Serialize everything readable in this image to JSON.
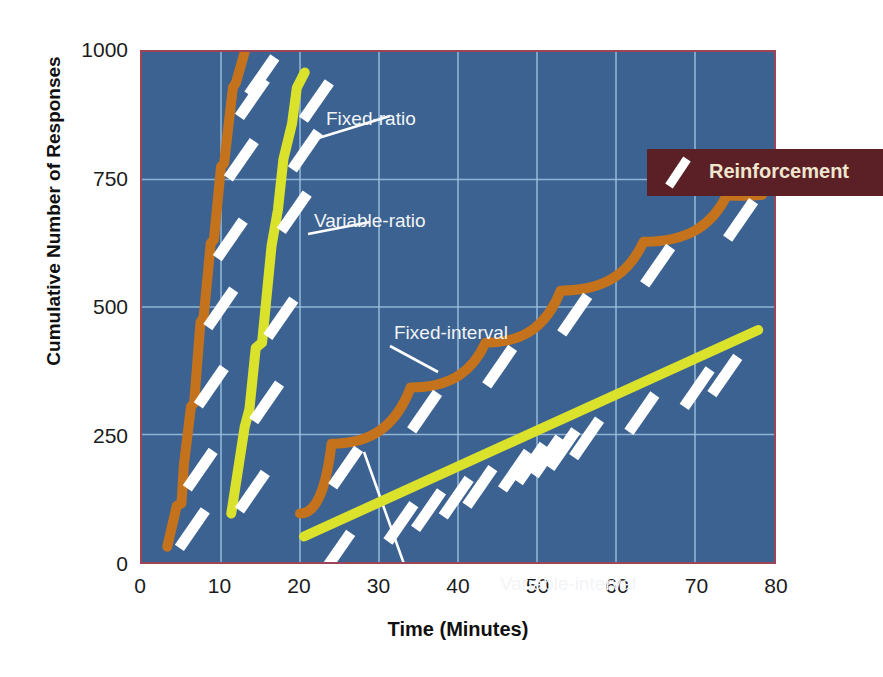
{
  "chart_data": {
    "type": "line",
    "title": "",
    "xlabel": "Time (Minutes)",
    "ylabel": "Cumulative Number of Responses",
    "xlim": [
      0,
      80
    ],
    "ylim": [
      0,
      1000
    ],
    "xticks": [
      0,
      10,
      20,
      30,
      40,
      50,
      60,
      70,
      80
    ],
    "yticks": [
      0,
      250,
      500,
      750,
      1000
    ],
    "grid": true,
    "background_color": "#3b6291",
    "grid_color": "#9fc4e0",
    "frame_color": "#9e4458",
    "legend": {
      "position": "top-right-inside",
      "box_color": "#5b2026",
      "text_color": "#efe6cf",
      "entries": [
        {
          "label": "Reinforcement",
          "marker": "white-tick-mark",
          "color": "#ffffff"
        }
      ]
    },
    "series": [
      {
        "name": "Fixed-ratio",
        "color": "#c4721c",
        "label_color": "#f2f4f6",
        "points": [
          [
            3.2,
            30
          ],
          [
            4.4,
            110
          ],
          [
            5.0,
            115
          ],
          [
            5.3,
            190
          ],
          [
            6.2,
            305
          ],
          [
            6.6,
            312
          ],
          [
            7.4,
            470
          ],
          [
            7.8,
            480
          ],
          [
            8.7,
            625
          ],
          [
            9.1,
            632
          ],
          [
            10.0,
            775
          ],
          [
            10.4,
            782
          ],
          [
            11.5,
            930
          ],
          [
            11.9,
            940
          ],
          [
            13.0,
            1000
          ]
        ],
        "reinforcement_marks_at": [
          4.6,
          5.6,
          7.0,
          8.2,
          9.4,
          10.8,
          12.2,
          13.4
        ]
      },
      {
        "name": "Variable-ratio",
        "color": "#dbe22c",
        "label_color": "#f2f4f6",
        "points": [
          [
            11.3,
            95
          ],
          [
            13.0,
            265
          ],
          [
            13.6,
            300
          ],
          [
            14.4,
            420
          ],
          [
            15.2,
            430
          ],
          [
            16.4,
            620
          ],
          [
            17.2,
            690
          ],
          [
            17.9,
            790
          ],
          [
            19.0,
            860
          ],
          [
            19.6,
            930
          ],
          [
            20.6,
            960
          ]
        ],
        "reinforcement_marks_at": [
          12.2,
          14.0,
          15.8,
          17.5,
          18.9,
          20.3
        ]
      },
      {
        "name": "Fixed-interval",
        "color": "#c4721c",
        "label_color": "#f2f4f6",
        "scallops": [
          {
            "start_x": 20.0,
            "start_y": 95,
            "end_x": 24.0,
            "end_y": 232
          },
          {
            "start_x": 24.0,
            "start_y": 232,
            "end_x": 34.0,
            "end_y": 342
          },
          {
            "start_x": 34.0,
            "start_y": 342,
            "end_x": 43.5,
            "end_y": 430
          },
          {
            "start_x": 43.5,
            "start_y": 430,
            "end_x": 53.0,
            "end_y": 532
          },
          {
            "start_x": 53.0,
            "start_y": 532,
            "end_x": 63.5,
            "end_y": 628
          },
          {
            "start_x": 63.5,
            "start_y": 628,
            "end_x": 74.0,
            "end_y": 718
          },
          {
            "start_x": 74.0,
            "start_y": 718,
            "end_x": 78.5,
            "end_y": 720
          }
        ],
        "reinforcement_marks_at": [
          24.0,
          34.0,
          43.5,
          53.0,
          63.5,
          74.0
        ]
      },
      {
        "name": "Variable-interval",
        "color": "#dbe22c",
        "label_color": "#f2f4f6",
        "points": [
          [
            20.5,
            50
          ],
          [
            78.0,
            455
          ]
        ],
        "reinforcement_marks_at": [
          23.0,
          31.0,
          34.5,
          38.0,
          41.0,
          45.5,
          47.5,
          49.5,
          51.5,
          54.5,
          61.5,
          68.5,
          72.0
        ]
      }
    ],
    "annotations": [
      {
        "text": "Fixed-ratio",
        "x_px": 324,
        "y_px": 66,
        "leader_to_x_px": 245,
        "leader_to_y_px": 90
      },
      {
        "text": "Variable-ratio",
        "x_px": 312,
        "y_px": 168,
        "leader_to_x_px": 278,
        "leader_to_y_px": 186
      },
      {
        "text": "Fixed-interval",
        "x_px": 392,
        "y_px": 280,
        "leader_to_x_px": 512,
        "leader_to_y_px": 313
      },
      {
        "text": "Variable-interval",
        "x_px": 498,
        "y_px": 531,
        "leader_to_x_px": 463,
        "leader_to_y_px": 455
      }
    ]
  },
  "axes": {
    "y_title": "Cumulative Number of Responses",
    "x_title": "Time (Minutes)",
    "y_labels": [
      "1000",
      "750",
      "500",
      "250",
      "0"
    ],
    "x_labels": [
      "0",
      "10",
      "20",
      "30",
      "40",
      "50",
      "60",
      "70",
      "80"
    ]
  },
  "legend": {
    "title": "Reinforcement"
  },
  "callouts": {
    "fixed_ratio": "Fixed-ratio",
    "variable_ratio": "Variable-ratio",
    "fixed_interval": "Fixed-interval",
    "variable_interval": "Variable-interval"
  }
}
